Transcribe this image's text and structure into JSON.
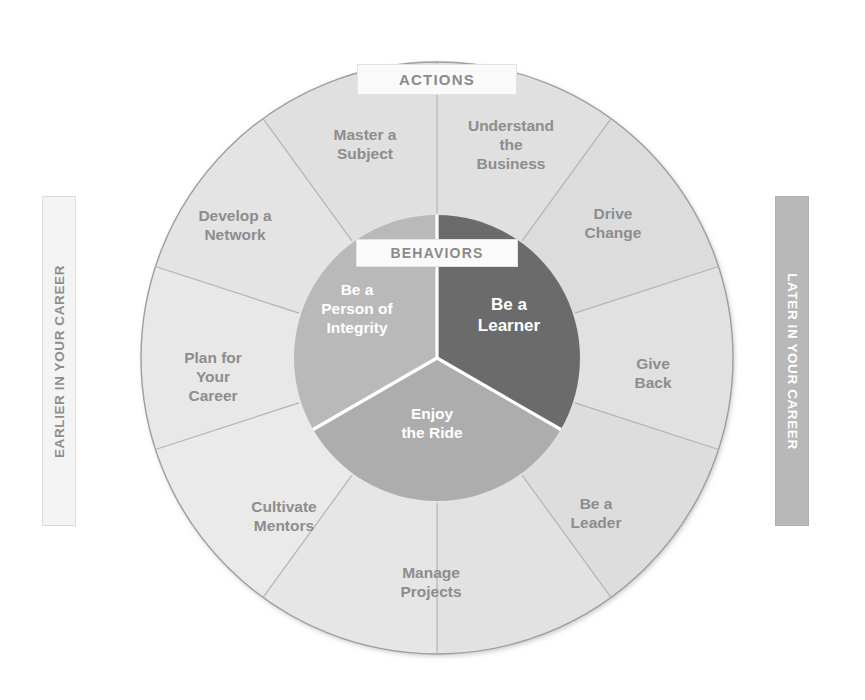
{
  "diagram": {
    "center": {
      "x": 437,
      "y": 358
    },
    "outer_radius": 296,
    "inner_radius": 143,
    "colors": {
      "outer_ring": "#e3e3e3",
      "outer_ring_alt": "#dedede",
      "outer_ring_stroke": "#9a9a9a",
      "divider": "#b4b4b4",
      "inner_light": "#b9b9b9",
      "inner_mid": "#adadad",
      "inner_dark": "#6b6b6b",
      "inner_divider": "#ffffff",
      "label_text": "#8d8d8d",
      "inner_text": "#ffffff",
      "banner_later_bg": "#b8b8b8",
      "banner_earlier_bg": "#f4f4f4"
    }
  },
  "chips": {
    "actions": "ACTIONS",
    "behaviors": "BEHAVIORS"
  },
  "side_banners": {
    "left": "EARLIER IN YOUR CAREER",
    "right": "LATER IN YOUR CAREER"
  },
  "outer_ring": {
    "name": "ACTIONS",
    "segment_count": 10,
    "segment_span_degrees": 36,
    "start_angle_degrees": 0,
    "segments": [
      {
        "index": 0,
        "label": "Understand the Business",
        "lines": [
          "Understand",
          "the",
          "Business"
        ],
        "angle_center_degrees": 18,
        "label_x": 511,
        "label_y": 131,
        "shade": "#e0e0e0"
      },
      {
        "index": 1,
        "label": "Drive Change",
        "lines": [
          "Drive",
          "Change"
        ],
        "angle_center_degrees": 54,
        "label_x": 613,
        "label_y": 219,
        "shade": "#dcdcdc"
      },
      {
        "index": 2,
        "label": "Give Back",
        "lines": [
          "Give",
          "Back"
        ],
        "angle_center_degrees": 90,
        "label_x": 653,
        "label_y": 369,
        "shade": "#e1e1e1"
      },
      {
        "index": 3,
        "label": "Be a Leader",
        "lines": [
          "Be a",
          "Leader"
        ],
        "angle_center_degrees": 126,
        "label_x": 596,
        "label_y": 509,
        "shade": "#dddddd"
      },
      {
        "index": 4,
        "label": "Manage Projects",
        "lines": [
          "Manage",
          "Projects"
        ],
        "angle_center_degrees": 162,
        "label_x": 431,
        "label_y": 578,
        "shade": "#e2e2e2"
      },
      {
        "index": 5,
        "label": "Cultivate Mentors",
        "lines": [
          "Cultivate",
          "Mentors"
        ],
        "angle_center_degrees": 198,
        "label_x": 284,
        "label_y": 512,
        "shade": "#e6e6e6"
      },
      {
        "index": 6,
        "label": "Plan for Your Career",
        "lines": [
          "Plan for",
          "Your",
          "Career"
        ],
        "angle_center_degrees": 234,
        "label_x": 213,
        "label_y": 363,
        "shade": "#eaeaea"
      },
      {
        "index": 7,
        "label": "Develop a Network",
        "lines": [
          "Develop a",
          "Network"
        ],
        "angle_center_degrees": 270,
        "label_x": 235,
        "label_y": 221,
        "shade": "#e8e8e8"
      },
      {
        "index": 8,
        "label": "Master a Subject",
        "lines": [
          "Master a",
          "Subject"
        ],
        "angle_center_degrees": 306,
        "label_x": 365,
        "label_y": 140,
        "shade": "#e4e4e4"
      },
      {
        "index": 9,
        "label": "",
        "lines": [],
        "angle_center_degrees": 342,
        "label_x": 0,
        "label_y": 0,
        "shade": "#e0e0e0"
      }
    ]
  },
  "inner_ring": {
    "name": "BEHAVIORS",
    "segment_count": 3,
    "segments": [
      {
        "index": 0,
        "label": "Be a Learner",
        "lines": [
          "Be a",
          "Learner"
        ],
        "start_angle_degrees": 0,
        "end_angle_degrees": 120,
        "fill": "#6b6b6b",
        "label_x": 509,
        "label_y": 310,
        "emphasis": true
      },
      {
        "index": 1,
        "label": "Enjoy the Ride",
        "lines": [
          "Enjoy",
          "the Ride"
        ],
        "start_angle_degrees": 120,
        "end_angle_degrees": 240,
        "fill": "#adadad",
        "label_x": 432,
        "label_y": 419,
        "emphasis": false
      },
      {
        "index": 2,
        "label": "Be a Person of Integrity",
        "lines": [
          "Be a",
          "Person of",
          "Integrity"
        ],
        "start_angle_degrees": 240,
        "end_angle_degrees": 360,
        "fill": "#b9b9b9",
        "label_x": 357,
        "label_y": 295,
        "emphasis": false
      }
    ]
  }
}
